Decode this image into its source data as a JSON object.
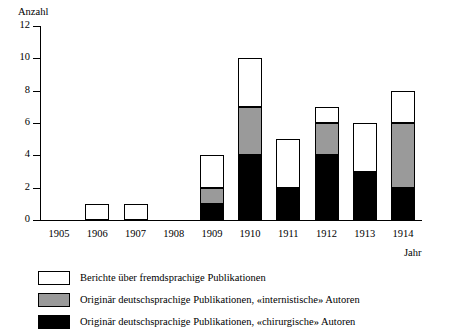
{
  "chart_data": {
    "type": "bar",
    "stacked": true,
    "title": "",
    "xlabel": "Jahr",
    "ylabel": "Anzahl",
    "categories": [
      "1905",
      "1906",
      "1907",
      "1908",
      "1909",
      "1910",
      "1911",
      "1912",
      "1913",
      "1914"
    ],
    "ylim": [
      0,
      12
    ],
    "yticks": [
      0,
      2,
      4,
      6,
      8,
      10,
      12
    ],
    "grid": false,
    "legend_position": "bottom-left",
    "series": [
      {
        "name": "Originär deutschsprachige Publikationen, «chirurgische» Autoren",
        "color": "#000000",
        "values": [
          0,
          0,
          0,
          0,
          1,
          4,
          2,
          4,
          3,
          2
        ]
      },
      {
        "name": "Originär deutschsprachige Publikationen, «internistische» Autoren",
        "color": "#9a9a9a",
        "values": [
          0,
          0,
          0,
          0,
          1,
          3,
          0,
          2,
          0,
          4
        ]
      },
      {
        "name": "Berichte über fremdsprachige Publikationen",
        "color": "#ffffff",
        "values": [
          0,
          1,
          1,
          0,
          2,
          3,
          3,
          1,
          3,
          2
        ]
      }
    ],
    "totals": [
      0,
      1,
      1,
      0,
      4,
      10,
      5,
      7,
      6,
      8
    ]
  },
  "legend": {
    "entries": [
      {
        "label": "Berichte über fremdsprachige Publikationen",
        "color": "#ffffff",
        "name": "legend-white"
      },
      {
        "label": "Originär deutschsprachige Publikationen, «internistische» Autoren",
        "color": "#9a9a9a",
        "name": "legend-gray"
      },
      {
        "label": "Originär deutschsprachige Publikationen, «chirurgische» Autoren",
        "color": "#000000",
        "name": "legend-black"
      }
    ]
  },
  "axes": {
    "y_title": "Anzahl",
    "x_title": "Jahr",
    "y_tick_labels": [
      "0",
      "2",
      "4",
      "6",
      "8",
      "10",
      "12"
    ],
    "x_tick_labels": [
      "1905",
      "1906",
      "1907",
      "1908",
      "1909",
      "1910",
      "1911",
      "1912",
      "1913",
      "1914"
    ]
  }
}
